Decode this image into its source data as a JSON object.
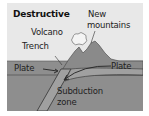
{
  "diagram": {
    "title": "Destructive",
    "labels": {
      "new_mountains_line1": "New",
      "new_mountains_line2": "mountains",
      "volcano": "Volcano",
      "trench": "Trench",
      "plate_left": "Plate",
      "plate_right": "Plate",
      "subduction_line1": "Subduction",
      "subduction_line2": "zone"
    },
    "colors": {
      "sky": "#e8e8e8",
      "crust": "#8c8c8c",
      "mountain": "#8a8a8a",
      "subducting_plate": "#9a9a9a",
      "outline": "#333333",
      "text": "#222222"
    }
  }
}
